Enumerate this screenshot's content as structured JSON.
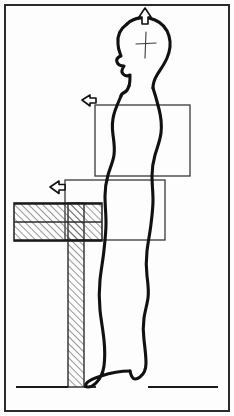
{
  "figure": {
    "canvas": {
      "width": 234,
      "height": 416
    },
    "colors": {
      "background": "#fdfdfd",
      "ink": "#1a1a1a",
      "body_outline": "#111111",
      "thin_line": "#3a3a3a",
      "hatch": "#444444",
      "border": "#2b2b2b"
    }
  },
  "border": {
    "name": "frame",
    "x": 5,
    "y": 5,
    "width": 224,
    "height": 406,
    "stroke_width": 2
  },
  "figure_person": {
    "label": "standing-person-side-profile",
    "facing": "left",
    "head": {
      "center_x": 138,
      "center_y": 44,
      "crosshair": {
        "center_x": 146,
        "center_y": 45,
        "vertical_extent": 26,
        "horizontal_extent": 20,
        "label": "head-reference-crosshair"
      }
    },
    "floor_contact_y": 387
  },
  "arrows": [
    {
      "id": "arrow-head-up",
      "direction": "up",
      "x": 145,
      "y": 16,
      "size": 14,
      "meaning": "raise-head-height"
    },
    {
      "id": "arrow-upper-left",
      "direction": "left",
      "x": 90,
      "y": 99,
      "size": 11,
      "meaning": "adjust-upper-reference-depth"
    },
    {
      "id": "arrow-lower-left",
      "direction": "left",
      "x": 58,
      "y": 186,
      "size": 12,
      "meaning": "adjust-lower-reference-depth"
    }
  ],
  "rectangles": [
    {
      "id": "upper-reference-rectangle",
      "x": 95,
      "y": 105,
      "width": 95,
      "height": 71,
      "label": "upper work zone"
    },
    {
      "id": "lower-reference-rectangle",
      "x": 65,
      "y": 180,
      "width": 100,
      "height": 60,
      "label": "lower work zone"
    }
  ],
  "desk": {
    "label": "hatched-desk-slab",
    "slab": {
      "x": 14,
      "y": 203,
      "width": 88,
      "height": 38,
      "divider_y": 222
    },
    "post": {
      "x": 68,
      "y": 203,
      "width": 16,
      "height": 184
    },
    "hatch_spacing": 5,
    "hatch_angle_deg": 45
  },
  "floor": {
    "label": "floor-line",
    "y": 387,
    "segments": [
      {
        "x1": 16,
        "x2": 68
      },
      {
        "x1": 84,
        "x2": 96
      },
      {
        "x1": 148,
        "x2": 218
      }
    ]
  }
}
